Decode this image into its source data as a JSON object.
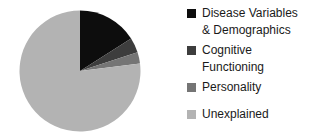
{
  "background_color": "#ffffff",
  "text_color": "#1a1a1a",
  "chart_data": {
    "type": "pie",
    "title": "",
    "legend_position": "right",
    "start_angle_deg": 0,
    "direction": "clockwise",
    "unit": "%",
    "slices": [
      {
        "label": "Disease Variables & Demographics",
        "value": 16,
        "color": "#0d0d0d"
      },
      {
        "label": "Cognitive Functioning",
        "value": 4,
        "color": "#3d3d3d"
      },
      {
        "label": "Personality",
        "value": 3,
        "color": "#757575"
      },
      {
        "label": "Unexplained",
        "value": 77,
        "color": "#b3b3b3"
      }
    ]
  }
}
